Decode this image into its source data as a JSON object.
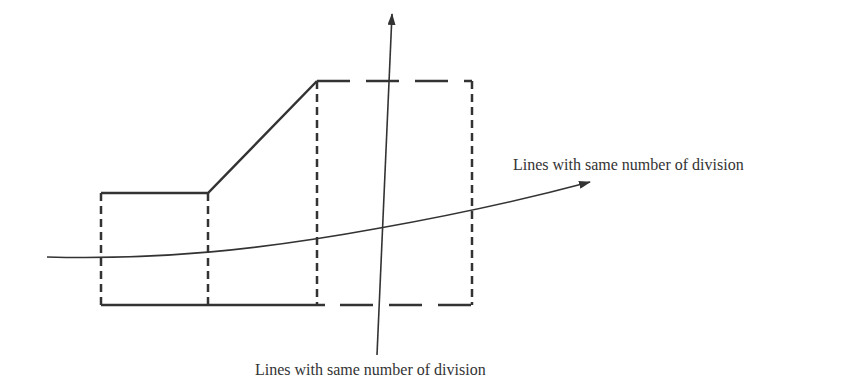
{
  "diagram": {
    "type": "mesh-division-schematic",
    "labels": {
      "horizontal_lines": "Lines with same number of division",
      "vertical_lines": "Lines with same number of division"
    },
    "colors": {
      "stroke": "#333333",
      "background": "#ffffff",
      "text": "#333333"
    },
    "regions": [
      {
        "name": "left-block",
        "edges": "solid top/bottom, dashed sides"
      },
      {
        "name": "middle-block",
        "edges": "solid sloped top, solid bottom, dashed right side"
      },
      {
        "name": "right-block",
        "edges": "dashed all sides"
      }
    ]
  }
}
